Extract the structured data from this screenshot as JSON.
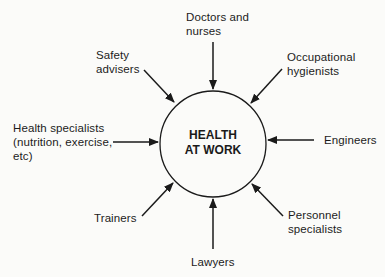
{
  "diagram": {
    "type": "hub-and-spoke",
    "center": {
      "label": "HEALTH\nAT WORK"
    },
    "contributors": [
      {
        "id": "doctors",
        "label": "Doctors and\nnurses",
        "direction": "top"
      },
      {
        "id": "occupational",
        "label": "Occupational\nhygienists",
        "direction": "top-right"
      },
      {
        "id": "engineers",
        "label": "Engineers",
        "direction": "right"
      },
      {
        "id": "personnel",
        "label": "Personnel\nspecialists",
        "direction": "bottom-right"
      },
      {
        "id": "lawyers",
        "label": "Lawyers",
        "direction": "bottom"
      },
      {
        "id": "trainers",
        "label": "Trainers",
        "direction": "bottom-left"
      },
      {
        "id": "health",
        "label": "Health specialists\n(nutrition, exercise,\netc)",
        "direction": "left"
      },
      {
        "id": "safety",
        "label": "Safety\nadvisers",
        "direction": "top-left"
      }
    ],
    "colors": {
      "stroke": "#1a1a1a",
      "background": "#fbfbf9"
    }
  }
}
